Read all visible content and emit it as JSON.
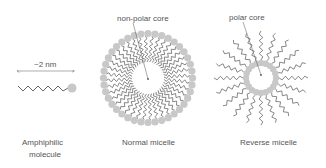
{
  "colors": {
    "head": "#c8c8c8",
    "tail": "#555555",
    "text": "#555555",
    "arrow": "#777777",
    "background": "#ffffff"
  },
  "panels": {
    "amphiphile": {
      "caption_line1": "Amphiphilic",
      "caption_line2": "molecule",
      "scale_label": "~2 nm"
    },
    "normal_micelle": {
      "caption": "Normal micelle",
      "annotation": "non-polar core",
      "molecule_count": 40
    },
    "reverse_micelle": {
      "caption": "Reverse micelle",
      "annotation": "polar core",
      "molecule_count": 20
    }
  }
}
